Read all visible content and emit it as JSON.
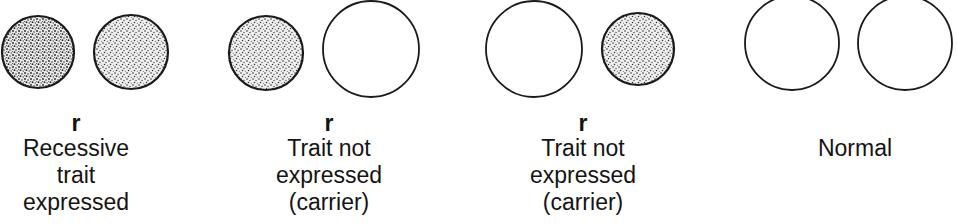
{
  "diagram": {
    "type": "chromosome-pair-inheritance",
    "colors": {
      "stroke": "#1a1a1a",
      "stipple_dark": "#2a2a2a",
      "fill_open": "#ffffff"
    },
    "groups": [
      {
        "id": "recessive-expressed",
        "allele": "r",
        "lines": [
          "Recessive",
          "trait",
          "expressed"
        ],
        "circles": [
          {
            "cx": 38,
            "cy": 52,
            "r": 36,
            "filled": true,
            "dense": true
          },
          {
            "cx": 131,
            "cy": 52,
            "r": 37,
            "filled": true,
            "dense": false
          }
        ],
        "label_center_x": 76
      },
      {
        "id": "carrier-left",
        "allele": "r",
        "lines": [
          "Trait not",
          "expressed",
          "(carrier)"
        ],
        "circles": [
          {
            "cx": 266,
            "cy": 53,
            "r": 37,
            "filled": true
          },
          {
            "cx": 371,
            "cy": 49,
            "r": 48,
            "filled": false
          }
        ],
        "label_center_x": 329
      },
      {
        "id": "carrier-right",
        "allele": "r",
        "lines": [
          "Trait not",
          "expressed",
          "(carrier)"
        ],
        "circles": [
          {
            "cx": 534,
            "cy": 49,
            "r": 48,
            "filled": false
          },
          {
            "cx": 638,
            "cy": 49,
            "r": 36,
            "filled": true
          }
        ],
        "label_center_x": 583
      },
      {
        "id": "normal",
        "allele": "",
        "lines": [
          "Normal"
        ],
        "circles": [
          {
            "cx": 792,
            "cy": 43,
            "r": 47,
            "filled": false
          },
          {
            "cx": 905,
            "cy": 43,
            "r": 47,
            "filled": false
          }
        ],
        "label_center_x": 855
      }
    ]
  }
}
